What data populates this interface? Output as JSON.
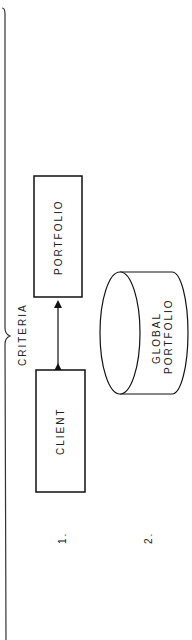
{
  "diagram": {
    "brace_label": "CRITERIA",
    "boxes": [
      {
        "id": "portfolio",
        "label": "PORTFOLIO"
      },
      {
        "id": "client",
        "label": "CLIENT"
      }
    ],
    "database": {
      "label_line1": "GLOBAL",
      "label_line2": "PORTFOLIO"
    },
    "steps": [
      {
        "label": "1."
      },
      {
        "label": "2."
      }
    ],
    "connector": "bidirectional-arrow"
  }
}
